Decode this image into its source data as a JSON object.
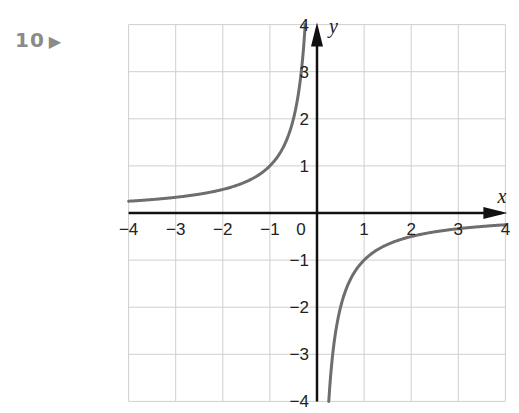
{
  "question": {
    "number": "10",
    "marker": "▶"
  },
  "chart_data": {
    "type": "line",
    "title": "",
    "function": "y = -1/x",
    "xlabel": "x",
    "ylabel": "y",
    "xlim": [
      -4,
      4
    ],
    "ylim": [
      -4,
      4
    ],
    "grid": true,
    "x_ticks": [
      "-4",
      "-3",
      "-2",
      "-1",
      "0",
      "1",
      "2",
      "3",
      "4"
    ],
    "y_ticks": [
      "-4",
      "-3",
      "-2",
      "-1",
      "1",
      "2",
      "3",
      "4"
    ],
    "series": [
      {
        "name": "branch-left",
        "x": [
          -4,
          -3,
          -2,
          -1,
          -0.5,
          -0.25
        ],
        "y": [
          0.25,
          0.333,
          0.5,
          1,
          2,
          4
        ]
      },
      {
        "name": "branch-right",
        "x": [
          0.25,
          0.5,
          1,
          2,
          3,
          4
        ],
        "y": [
          -4,
          -2,
          -1,
          -0.5,
          -0.333,
          -0.25
        ]
      }
    ],
    "colors": {
      "curve": "#6e6e6e",
      "axes": "#111111",
      "grid": "#cfcfcf"
    }
  }
}
